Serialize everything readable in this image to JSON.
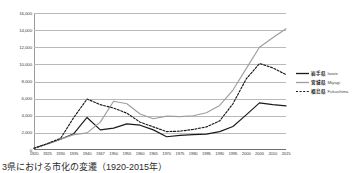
{
  "chart_data": {
    "type": "line",
    "title": "",
    "xlabel": "",
    "ylabel": "",
    "ylim": [
      0,
      16000
    ],
    "ytick_step": 2000,
    "grid": true,
    "legend_position": "right",
    "categories": [
      "1920",
      "1925",
      "1930",
      "1935",
      "1940",
      "1947",
      "1950",
      "1955",
      "1960",
      "1965",
      "1970",
      "1975",
      "1980",
      "1985",
      "1990",
      "1995",
      "2000",
      "2005",
      "2010",
      "2015"
    ],
    "series": [
      {
        "name": "岩手県 Iwate",
        "name_jp": "岩手県",
        "name_en": "Iwate",
        "color": "#1a1a1a",
        "style": "solid",
        "values": [
          200,
          700,
          1250,
          1900,
          3800,
          2350,
          2550,
          3050,
          2900,
          2350,
          1550,
          1700,
          1800,
          1850,
          2150,
          2750,
          4100,
          5500,
          5300,
          5150
        ]
      },
      {
        "name": "宮城県 Miyagi",
        "name_jp": "宮城県",
        "name_en": "Miyagi",
        "color": "#9e9e9e",
        "style": "solid",
        "values": [
          200,
          700,
          1250,
          1800,
          2000,
          3250,
          5700,
          5400,
          4200,
          3650,
          3950,
          3900,
          4000,
          4350,
          5200,
          7000,
          9500,
          12000,
          13100,
          14150
        ]
      },
      {
        "name": "福島県 Fukushima",
        "name_jp": "福島県",
        "name_en": "Fukushima",
        "color": "#1a1a1a",
        "style": "dashed",
        "values": [
          200,
          750,
          1350,
          3800,
          5950,
          5300,
          4900,
          4300,
          3250,
          2700,
          2150,
          2200,
          2400,
          2700,
          3400,
          5400,
          8300,
          10100,
          9600,
          8800
        ]
      }
    ],
    "ytick_labels": [
      "16,000",
      "14,000",
      "12,000",
      "10,000",
      "8,000",
      "6,000",
      "4,000",
      "2,000",
      "0"
    ],
    "ytick_values": [
      16000,
      14000,
      12000,
      10000,
      8000,
      6000,
      4000,
      2000,
      0
    ]
  },
  "caption": {
    "text": "3県における市化の変遷（1920-2015年）"
  }
}
